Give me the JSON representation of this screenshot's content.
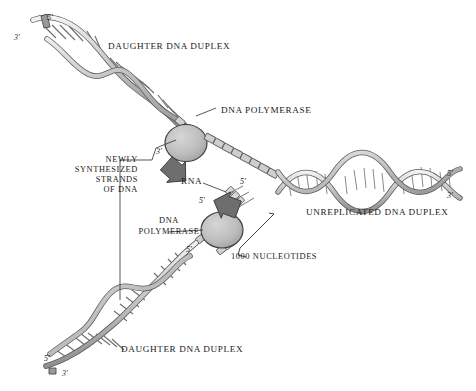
{
  "figure": {
    "background_color": "#ffffff",
    "ink_color": "#1a1a1a",
    "strand_fill": "#c9c9c9",
    "strand_stroke": "#4a4a4a",
    "enzyme_fill": "#b9b9b9",
    "enzyme_stroke": "#3c3c3c",
    "arrow_fill": "#6e6e6e"
  },
  "labels": {
    "daughter_top": "DAUGHTER DNA DUPLEX",
    "daughter_bottom": "DAUGHTER DNA DUPLEX",
    "unreplicated": "UNREPLICATED DNA DUPLEX",
    "polymerase_top": "DNA POLYMERASE",
    "polymerase_bottom_line1": "DNA",
    "polymerase_bottom_line2": "POLYMERASE",
    "rna": "RNA",
    "nucleotides": "1000 NUCLEOTIDES",
    "newly_line1": "NEWLY",
    "newly_line2": "SYNTHESIZED",
    "newly_line3": "STRANDS",
    "newly_line4": "OF DNA"
  },
  "termini": {
    "top_left_three": "3'",
    "top_left_five": "5'",
    "fork_top_three": "3'",
    "rna_top_five": "5'",
    "rna_bottom_five": "5'",
    "lagging_five": "5'",
    "bottom_left_five": "5'",
    "bottom_left_three": "3'",
    "right_five": "5'",
    "right_three": "3'"
  },
  "icons": {
    "arrow_top": "arrow-down-right-icon",
    "arrow_bottom": "arrow-down-left-icon",
    "enzyme_top": "dna-polymerase-ellipse-icon",
    "enzyme_bottom": "dna-polymerase-ellipse-icon",
    "bracket": "nucleotide-span-bracket-icon"
  }
}
